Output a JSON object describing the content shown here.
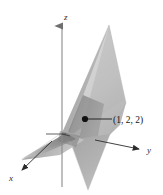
{
  "figure": {
    "type": "3d-plane-diagram",
    "title": "",
    "background_color": "#ffffff",
    "axes": {
      "z": {
        "label": "z",
        "label_position": {
          "x": 64,
          "y": 19
        },
        "line": {
          "x1": 62,
          "y1": 186,
          "x2": 62,
          "y2": 24
        },
        "arrow": "up",
        "color": "#7a7a7a"
      },
      "y": {
        "label": "y",
        "label_position": {
          "x": 148,
          "y": 152
        },
        "line": {
          "x1": 95,
          "y1": 140,
          "x2": 141,
          "y2": 150
        },
        "arrow": "right-down",
        "color": "#2b2b2b"
      },
      "x": {
        "label": "x",
        "label_position": {
          "x": 11,
          "y": 180
        },
        "line": {
          "x1": 46,
          "y1": 145,
          "x2": 20,
          "y2": 172
        },
        "arrow": "left-down",
        "color": "#2b2b2b"
      }
    },
    "point": {
      "label": "(1, 2, 2)",
      "marker_position": {
        "x": 85,
        "y": 119
      },
      "marker_radius": 3.1,
      "marker_color": "#111111",
      "leader_line": {
        "x1": 88,
        "y1": 119,
        "x2": 112,
        "y2": 119
      },
      "label_position": {
        "x": 114,
        "y": 123
      }
    },
    "plane": {
      "description": "shaded plane through origin region",
      "fill_light": "#d6d6d6",
      "fill_mid": "#b5b5b5",
      "fill_dark": "#8d8d8d",
      "fill_darkest": "#6e6e6e",
      "edge_color": "#9a9a9a"
    }
  }
}
